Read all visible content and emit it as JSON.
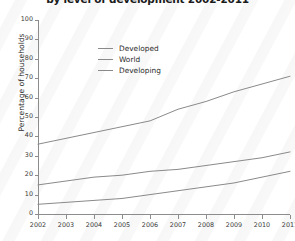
{
  "chart_data": {
    "type": "line",
    "title": "by level of development 2002-2011",
    "xlabel": "",
    "ylabel": "Percentage of households",
    "categories": [
      "2002",
      "2003",
      "2004",
      "2005",
      "2006",
      "2007",
      "2008",
      "2009",
      "2010",
      "2011"
    ],
    "x": [
      2002,
      2003,
      2004,
      2005,
      2006,
      2007,
      2008,
      2009,
      2010,
      2011
    ],
    "series": [
      {
        "name": "Developed",
        "values": [
          36,
          39,
          42,
          45,
          48,
          54,
          58,
          63,
          67,
          71
        ]
      },
      {
        "name": "World",
        "values": [
          15,
          17,
          19,
          20,
          22,
          23,
          25,
          27,
          29,
          32
        ]
      },
      {
        "name": "Developing",
        "values": [
          5,
          6,
          7,
          8,
          10,
          12,
          14,
          16,
          19,
          22
        ]
      }
    ],
    "ylim": [
      0,
      100
    ],
    "yticks": [
      0,
      10,
      20,
      30,
      40,
      50,
      60,
      70,
      80,
      90,
      100
    ],
    "xlim": [
      2002,
      2011
    ],
    "grid": false,
    "legend_position": "upper-center",
    "line_color": "#8a8a8a"
  }
}
